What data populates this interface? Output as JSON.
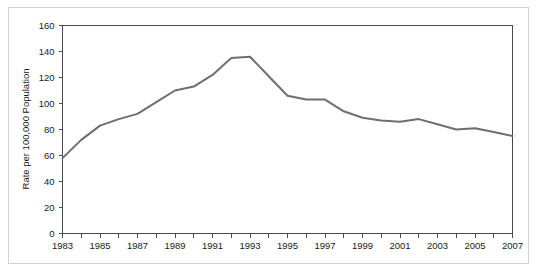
{
  "chart_data": {
    "type": "line",
    "title": "",
    "subtitle": "",
    "xlabel": "",
    "ylabel": "Rate per 100,000 Population",
    "xlim": [
      1983,
      2007
    ],
    "ylim": [
      0,
      160
    ],
    "ytick_step": 20,
    "xtick_step": 1,
    "xtick_label_step": 2,
    "grid": false,
    "legend": "none",
    "line_color": "#6e6e6e",
    "axis_color": "#4a4a4a",
    "frame_color": "#d2d2d2",
    "background": "#ffffff",
    "ytick_labels": [
      "0",
      "20",
      "40",
      "60",
      "80",
      "100",
      "120",
      "140",
      "160"
    ],
    "ytick_values": [
      0,
      20,
      40,
      60,
      80,
      100,
      120,
      140,
      160
    ],
    "xtick_labels": [
      "1983",
      "",
      "1985",
      "",
      "1987",
      "",
      "1989",
      "",
      "1991",
      "",
      "1993",
      "",
      "1995",
      "",
      "1997",
      "",
      "1999",
      "",
      "2001",
      "",
      "2003",
      "",
      "2005",
      "",
      "2007"
    ],
    "x": [
      1983,
      1984,
      1985,
      1986,
      1987,
      1988,
      1989,
      1990,
      1991,
      1992,
      1993,
      1994,
      1995,
      1996,
      1997,
      1998,
      1999,
      2000,
      2001,
      2002,
      2003,
      2004,
      2005,
      2006,
      2007
    ],
    "values": [
      58,
      72,
      83,
      88,
      92,
      101,
      110,
      113,
      122,
      135,
      136,
      121,
      106,
      103,
      103,
      94,
      89,
      87,
      86,
      88,
      84,
      80,
      81,
      78,
      75
    ],
    "series": [
      {
        "name": "Rate per 100,000 Population",
        "values": [
          58,
          72,
          83,
          88,
          92,
          101,
          110,
          113,
          122,
          135,
          136,
          121,
          106,
          103,
          103,
          94,
          89,
          87,
          86,
          88,
          84,
          80,
          81,
          78,
          75
        ]
      }
    ],
    "annotations": []
  }
}
